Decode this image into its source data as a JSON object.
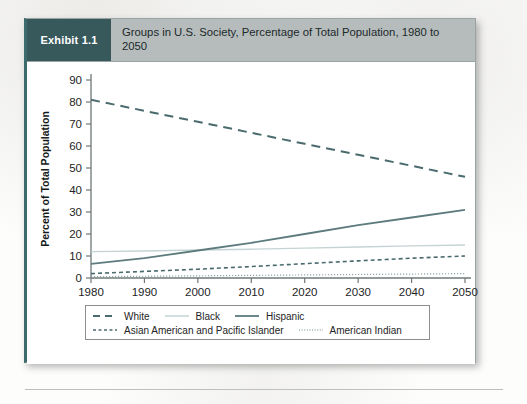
{
  "exhibit": {
    "badge_label": "Exhibit 1.1",
    "title": "Groups in U.S. Society, Percentage of Total Population, 1980 to 2050",
    "badge_color": "#37595c",
    "header_color": "#b6bcbb"
  },
  "chart_data": {
    "type": "line",
    "title": "Groups in U.S. Society, Percentage of Total Population, 1980 to 2050",
    "xlabel": "",
    "ylabel": "Percent of Total Population",
    "x": [
      1980,
      1990,
      2000,
      2010,
      2020,
      2030,
      2040,
      2050
    ],
    "xlim": [
      1980,
      2050
    ],
    "ylim": [
      0,
      90
    ],
    "yticks": [
      0,
      10,
      20,
      30,
      40,
      50,
      60,
      70,
      80,
      90
    ],
    "xticks": [
      "1980",
      "1990",
      "2000",
      "2010",
      "2020",
      "2030",
      "2040",
      "2050"
    ],
    "grid": false,
    "legend_position": "bottom",
    "series": [
      {
        "name": "White",
        "values": [
          81,
          76,
          71,
          66,
          61,
          56,
          51,
          46
        ],
        "style": "dashed",
        "color": "#4a6b6e",
        "width": 2.0
      },
      {
        "name": "Black",
        "values": [
          12,
          12.3,
          12.7,
          13.1,
          13.6,
          14.1,
          14.6,
          15
        ],
        "style": "solid",
        "color": "#c5d3d4",
        "width": 1.4
      },
      {
        "name": "Hispanic",
        "values": [
          6.4,
          9,
          12.5,
          16,
          20,
          24,
          27.5,
          31
        ],
        "style": "solid",
        "color": "#5d7b7d",
        "width": 1.8
      },
      {
        "name": "Asian American and Pacific Islander",
        "values": [
          2,
          3,
          4,
          5.2,
          6.5,
          7.8,
          9,
          10
        ],
        "style": "short-dash",
        "color": "#4a6b6e",
        "width": 1.6
      },
      {
        "name": "American Indian",
        "values": [
          0.6,
          0.8,
          1,
          1.2,
          1.4,
          1.6,
          1.8,
          2
        ],
        "style": "dotted",
        "color": "#8fa5a6",
        "width": 1.2
      }
    ]
  },
  "legend": {
    "row1": [
      {
        "label": "White",
        "swatch": "dashed-line-swatch"
      },
      {
        "label": "Black",
        "swatch": "light-solid-line-swatch"
      },
      {
        "label": "Hispanic",
        "swatch": "solid-line-swatch"
      }
    ],
    "row2": [
      {
        "label": "Asian American and Pacific Islander",
        "swatch": "short-dash-line-swatch"
      },
      {
        "label": "American Indian",
        "swatch": "dotted-line-swatch"
      }
    ]
  }
}
